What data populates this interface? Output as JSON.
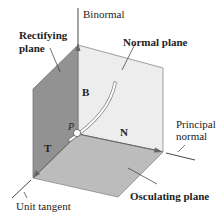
{
  "figure": {
    "planes": {
      "rectifying": {
        "label_line1": "Rectifying",
        "label_line2": "plane",
        "color": "#8f8f8f"
      },
      "normal": {
        "label": "Normal plane",
        "color": "#eeeeee"
      },
      "osculating": {
        "label": "Osculating plane",
        "color": "#bdbdbd"
      }
    },
    "axes": {
      "binormal": "Binormal",
      "principal_normal_line1": "Principal",
      "principal_normal_line2": "normal",
      "unit_tangent": "Unit tangent"
    },
    "vectors": {
      "B": "B",
      "N": "N",
      "T": "T"
    },
    "point": "P"
  }
}
